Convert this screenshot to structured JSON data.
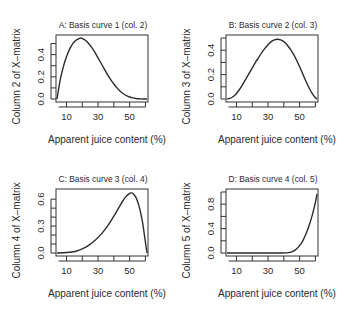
{
  "figure": {
    "panels_layout": "2x2"
  },
  "chart_data": [
    {
      "type": "line",
      "panel": "A",
      "title": "A: Basis curve 1 (col. 2)",
      "xlabel": "Apparent juice content (%)",
      "ylabel": "Column 2 of X–matrix",
      "xlim": [
        4,
        61
      ],
      "ylim": [
        0,
        0.55
      ],
      "xticks": [
        5,
        10,
        15,
        20,
        25,
        30,
        35,
        40,
        45,
        50,
        55,
        60
      ],
      "xtick_labels": [
        "10",
        "30",
        "50"
      ],
      "xtick_label_values": [
        10,
        30,
        50
      ],
      "yticks": [
        0,
        0.1,
        0.2,
        0.3,
        0.4,
        0.5
      ],
      "ytick_labels": [
        "0.0",
        "0.2",
        "0.4"
      ],
      "ytick_label_values": [
        0,
        0.2,
        0.4
      ],
      "grid": false,
      "x": [
        4,
        6,
        8,
        10,
        12,
        14,
        16,
        18,
        19,
        20,
        22,
        24,
        26,
        28,
        30,
        32,
        34,
        36,
        38,
        40,
        42,
        44,
        46,
        48,
        50,
        52,
        54,
        56,
        58,
        60,
        61
      ],
      "values": [
        0.0,
        0.17,
        0.29,
        0.38,
        0.45,
        0.5,
        0.53,
        0.545,
        0.55,
        0.545,
        0.53,
        0.5,
        0.465,
        0.42,
        0.37,
        0.32,
        0.27,
        0.22,
        0.175,
        0.135,
        0.1,
        0.07,
        0.047,
        0.03,
        0.018,
        0.01,
        0.005,
        0.002,
        0.001,
        0.0,
        0.0
      ]
    },
    {
      "type": "line",
      "panel": "B",
      "title": "B: Basis curve 2 (col. 3)",
      "xlabel": "Apparent juice content (%)",
      "ylabel": "Column 3 of X–matrix",
      "xlim": [
        4,
        61
      ],
      "ylim": [
        0,
        0.5
      ],
      "xticks": [
        5,
        10,
        15,
        20,
        25,
        30,
        35,
        40,
        45,
        50,
        55,
        60
      ],
      "xtick_labels": [
        "10",
        "30",
        "50"
      ],
      "xtick_label_values": [
        10,
        30,
        50
      ],
      "yticks": [
        0,
        0.1,
        0.2,
        0.3,
        0.4,
        0.5
      ],
      "ytick_labels": [
        "0.0",
        "0.2",
        "0.4"
      ],
      "ytick_label_values": [
        0,
        0.2,
        0.4
      ],
      "grid": false,
      "x": [
        4,
        6,
        8,
        10,
        12,
        14,
        16,
        18,
        20,
        22,
        24,
        26,
        28,
        30,
        32,
        34,
        36,
        38,
        40,
        42,
        44,
        46,
        48,
        50,
        52,
        54,
        56,
        58,
        60,
        61
      ],
      "values": [
        0.0,
        0.005,
        0.02,
        0.045,
        0.08,
        0.12,
        0.165,
        0.21,
        0.255,
        0.3,
        0.34,
        0.38,
        0.415,
        0.445,
        0.47,
        0.485,
        0.49,
        0.485,
        0.47,
        0.445,
        0.41,
        0.37,
        0.32,
        0.265,
        0.205,
        0.145,
        0.09,
        0.045,
        0.01,
        0.0
      ]
    },
    {
      "type": "line",
      "panel": "C",
      "title": "C: Basis curve 3 (col. 4)",
      "xlabel": "Apparent juice content (%)",
      "ylabel": "Column 4 of X–matrix",
      "xlim": [
        4,
        61
      ],
      "ylim": [
        0,
        0.68
      ],
      "xticks": [
        5,
        10,
        15,
        20,
        25,
        30,
        35,
        40,
        45,
        50,
        55,
        60
      ],
      "xtick_labels": [
        "10",
        "30",
        "50"
      ],
      "xtick_label_values": [
        10,
        30,
        50
      ],
      "yticks": [
        0,
        0.1,
        0.2,
        0.3,
        0.4,
        0.5,
        0.6
      ],
      "ytick_labels": [
        "0.0",
        "0.3",
        "0.6"
      ],
      "ytick_label_values": [
        0,
        0.3,
        0.6
      ],
      "grid": false,
      "x": [
        4,
        8,
        12,
        16,
        20,
        24,
        28,
        32,
        36,
        40,
        42,
        44,
        46,
        48,
        50,
        51,
        52,
        54,
        56,
        58,
        60,
        61
      ],
      "values": [
        0.0,
        0.002,
        0.008,
        0.02,
        0.045,
        0.085,
        0.14,
        0.21,
        0.3,
        0.41,
        0.47,
        0.53,
        0.59,
        0.635,
        0.665,
        0.67,
        0.665,
        0.62,
        0.52,
        0.36,
        0.12,
        0.0
      ]
    },
    {
      "type": "line",
      "panel": "D",
      "title": "D: Basis curve 4 (col. 5)",
      "xlabel": "Apparent juice content (%)",
      "ylabel": "Column 5 of X–matrix",
      "xlim": [
        4,
        61
      ],
      "ylim": [
        0,
        1.0
      ],
      "xticks": [
        5,
        10,
        15,
        20,
        25,
        30,
        35,
        40,
        45,
        50,
        55,
        60
      ],
      "xtick_labels": [
        "10",
        "30",
        "50"
      ],
      "xtick_label_values": [
        10,
        30,
        50
      ],
      "yticks": [
        0,
        0.2,
        0.4,
        0.6,
        0.8,
        1.0
      ],
      "ytick_labels": [
        "0.0",
        "0.4",
        "0.8"
      ],
      "ytick_label_values": [
        0,
        0.4,
        0.8
      ],
      "grid": false,
      "x": [
        4,
        10,
        20,
        30,
        38,
        42,
        44,
        46,
        48,
        50,
        52,
        54,
        56,
        58,
        60,
        61
      ],
      "values": [
        0.0,
        0.0,
        0.0,
        0.0,
        0.0,
        0.002,
        0.01,
        0.03,
        0.065,
        0.12,
        0.2,
        0.31,
        0.45,
        0.62,
        0.83,
        0.97
      ]
    }
  ]
}
